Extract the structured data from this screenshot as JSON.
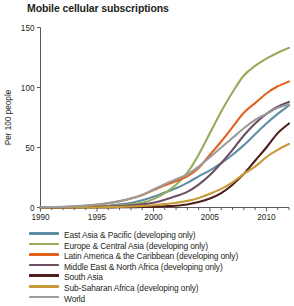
{
  "chart_data": {
    "type": "line",
    "title": "Mobile cellular subscriptions",
    "xlabel": "",
    "ylabel": "Per 100 people",
    "xlim": [
      1990,
      2012
    ],
    "ylim": [
      0,
      150
    ],
    "yticks": [
      0,
      50,
      100,
      150
    ],
    "ytick_labels": [
      "0",
      "50",
      "100",
      "150"
    ],
    "xticks": [
      1990,
      1991,
      1992,
      1993,
      1994,
      1995,
      1996,
      1997,
      1998,
      1999,
      2000,
      2001,
      2002,
      2003,
      2004,
      2005,
      2006,
      2007,
      2008,
      2009,
      2010,
      2011,
      2012
    ],
    "xtick_labels_shown": [
      1990,
      1995,
      2000,
      2005,
      2010
    ],
    "grid": false,
    "legend_position": "below",
    "x": [
      1990,
      1991,
      1992,
      1993,
      1994,
      1995,
      1996,
      1997,
      1998,
      1999,
      2000,
      2001,
      2002,
      2003,
      2004,
      2005,
      2006,
      2007,
      2008,
      2009,
      2010,
      2011,
      2012
    ],
    "series": [
      {
        "name": "East Asia & Pacific (developing only)",
        "color": "#5f8fa6",
        "values": [
          0.0,
          0.1,
          0.1,
          0.2,
          0.4,
          0.8,
          1.5,
          2.6,
          3.8,
          6.0,
          9.0,
          12.5,
          16.0,
          20.5,
          26.0,
          31.0,
          37.0,
          44.0,
          52.0,
          61.0,
          70.0,
          78.0,
          85.0
        ]
      },
      {
        "name": "Europe & Central Asia (developing only)",
        "color": "#97ab5c",
        "values": [
          0.0,
          0.0,
          0.1,
          0.2,
          0.3,
          0.5,
          0.9,
          1.6,
          2.5,
          4.0,
          7.0,
          12.0,
          19.0,
          29.0,
          44.0,
          62.0,
          80.0,
          96.0,
          110.0,
          118.0,
          124.0,
          129.0,
          133.0
        ]
      },
      {
        "name": "Latin America & the Caribbean (developing only)",
        "color": "#e2621b",
        "values": [
          0.1,
          0.2,
          0.4,
          0.8,
          1.4,
          2.3,
          3.5,
          5.2,
          7.5,
          10.5,
          14.5,
          18.5,
          22.0,
          26.0,
          33.0,
          44.0,
          55.0,
          67.0,
          79.0,
          87.0,
          95.0,
          101.0,
          105.0
        ]
      },
      {
        "name": "Middle East & North Africa (developing only)",
        "color": "#6c4f63",
        "values": [
          0.0,
          0.0,
          0.1,
          0.2,
          0.3,
          0.5,
          0.8,
          1.2,
          1.8,
          2.6,
          4.0,
          6.5,
          9.5,
          13.0,
          19.0,
          27.0,
          37.0,
          48.0,
          60.0,
          70.0,
          78.0,
          84.0,
          88.0
        ]
      },
      {
        "name": "South Asia",
        "color": "#4d1f18",
        "values": [
          0.0,
          0.0,
          0.0,
          0.0,
          0.0,
          0.1,
          0.1,
          0.2,
          0.3,
          0.4,
          0.6,
          1.0,
          1.5,
          2.5,
          4.5,
          7.5,
          12.0,
          19.0,
          28.0,
          39.0,
          50.0,
          62.0,
          70.0
        ]
      },
      {
        "name": "Sub-Saharan Africa (developing only)",
        "color": "#c79a3a",
        "values": [
          0.0,
          0.0,
          0.0,
          0.1,
          0.1,
          0.2,
          0.3,
          0.5,
          0.8,
          1.2,
          1.9,
          2.8,
          4.0,
          5.5,
          8.0,
          11.5,
          15.5,
          21.0,
          28.0,
          34.0,
          42.0,
          48.0,
          53.0
        ]
      },
      {
        "name": "World",
        "color": "#9b9b9b",
        "values": [
          0.2,
          0.4,
          0.6,
          1.0,
          1.6,
          2.5,
          3.7,
          5.3,
          7.5,
          10.5,
          15.0,
          19.5,
          23.5,
          27.5,
          34.0,
          42.0,
          50.0,
          58.0,
          66.0,
          73.0,
          78.0,
          83.0,
          86.0
        ]
      }
    ]
  },
  "legend": {
    "items": [
      {
        "label": "East Asia & Pacific (developing only)",
        "color": "#5f8fa6"
      },
      {
        "label": "Europe & Central Asia (developing only)",
        "color": "#97ab5c"
      },
      {
        "label": "Latin America & the Caribbean (developing only)",
        "color": "#e2621b"
      },
      {
        "label": "Middle East & North Africa (developing only)",
        "color": "#6c4f63"
      },
      {
        "label": "South Asia",
        "color": "#4d1f18"
      },
      {
        "label": "Sub-Saharan Africa (developing only)",
        "color": "#c79a3a"
      },
      {
        "label": "World",
        "color": "#9b9b9b"
      }
    ]
  }
}
